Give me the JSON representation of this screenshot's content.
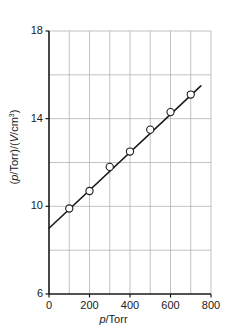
{
  "chart_data": {
    "type": "scatter",
    "title": "",
    "xlabel": "p/Torr",
    "ylabel": "(p/Torr)/(V/cm3)",
    "xlabel_parts": {
      "italic": "p",
      "rest": "/Torr"
    },
    "ylabel_parts": {
      "pre": "(",
      "italic_p": "p",
      "mid": "/Torr)/(",
      "italic_v": "V",
      "post": "/cm",
      "sup": "3",
      "close": ")"
    },
    "x": [
      100,
      200,
      300,
      400,
      500,
      600,
      700
    ],
    "y": [
      9.9,
      10.7,
      11.8,
      12.5,
      13.5,
      14.3,
      15.1
    ],
    "series": [
      {
        "name": "measurements",
        "marker": "open-circle",
        "marker_color": "#ffffff",
        "marker_edge_color": "#1a1a1a",
        "values": [
          9.9,
          10.7,
          11.8,
          12.5,
          13.5,
          14.3,
          15.1
        ]
      }
    ],
    "fit_line": {
      "type": "line",
      "name": "linear fit",
      "color": "#1a1a1a",
      "x_start": 0,
      "y_start": 9.0,
      "x_end": 750,
      "y_end": 15.5,
      "slope": 0.00867,
      "intercept": 9.0
    },
    "xlim": [
      0,
      800
    ],
    "ylim": [
      6,
      18
    ],
    "xticks": [
      0,
      200,
      400,
      600,
      800
    ],
    "xtick_labels": [
      "0",
      "200",
      "400",
      "600",
      "800"
    ],
    "yticks": [
      6,
      10,
      14,
      18
    ],
    "ytick_labels": [
      "6",
      "10",
      "14",
      "18"
    ],
    "x_gridlines": [
      100,
      200,
      300,
      400,
      500,
      600,
      700
    ],
    "y_gridlines": [
      8,
      10,
      12,
      14,
      16
    ],
    "grid": true,
    "grid_color": "#b3b3b3",
    "axis_color": "#1a1a1a",
    "legend": null,
    "legend_position": "none",
    "background_color": "#ffffff"
  }
}
